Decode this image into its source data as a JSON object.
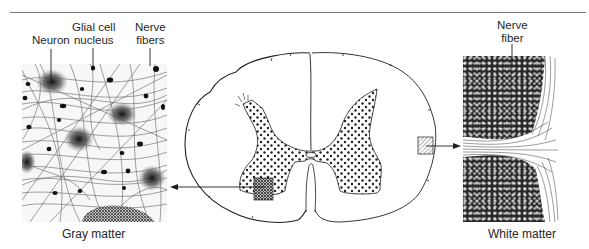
{
  "figure": {
    "type": "spinal-cord-cross-section",
    "panels": {
      "gray_matter": {
        "caption": "Gray matter",
        "callouts": [
          {
            "id": "neuron",
            "lines": [
              "Neuron"
            ]
          },
          {
            "id": "glial",
            "lines": [
              "Glial cell",
              "nucleus"
            ]
          },
          {
            "id": "nerve_fibers",
            "lines": [
              "Nerve",
              "fibers"
            ]
          }
        ]
      },
      "spinal_cord": {
        "gray_region_pattern": "stippled",
        "left_sample_pattern": "dense-stipple",
        "right_sample_pattern": "hatched"
      },
      "white_matter": {
        "caption": "White matter",
        "callouts": [
          {
            "id": "nerve_fiber",
            "lines": [
              "Nerve",
              "fiber"
            ]
          }
        ]
      }
    },
    "colors": {
      "ink": "#1e1e1e",
      "rule": "#777777",
      "background": "#ffffff"
    }
  }
}
